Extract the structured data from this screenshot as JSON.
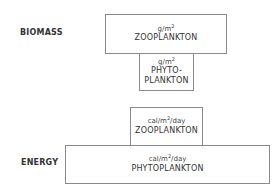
{
  "diagram": {
    "type": "ecological-pyramids",
    "biomass": {
      "label": "BIOMASS",
      "levels": [
        {
          "name": "ZOOPLANKTON",
          "unit_base": "g/m",
          "unit_exp": "2",
          "unit_suffix": ""
        },
        {
          "name_line1": "PHYTO-",
          "name_line2": "PLANKTON",
          "unit_base": "g/m",
          "unit_exp": "2",
          "unit_suffix": ""
        }
      ]
    },
    "energy": {
      "label": "ENERGY",
      "levels": [
        {
          "name": "ZOOPLANKTON",
          "unit_base": "cal/m",
          "unit_exp": "2",
          "unit_suffix": "/day"
        },
        {
          "name": "PHYTOPLANKTON",
          "unit_base": "cal/m",
          "unit_exp": "2",
          "unit_suffix": "/day"
        }
      ]
    },
    "colors": {
      "border": "#8a8a8a",
      "text": "#333333",
      "background": "#ffffff"
    }
  }
}
